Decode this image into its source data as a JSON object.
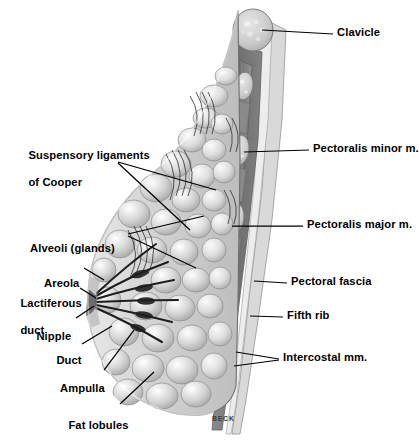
{
  "figure": {
    "signature": "BECK",
    "background_color": "#ffffff",
    "line_color": "#000000",
    "tissue_tones": {
      "fat_light": "#e3e3e3",
      "fat_mid": "#c4c4c4",
      "gland_light": "#efefef",
      "gland_shadow": "#9a9a9a",
      "muscle_dark": "#7e7e7e",
      "muscle_darker": "#6a6a6a",
      "bone_light": "#d8d8d8",
      "outline": "#4a4a4a"
    }
  },
  "labels_left": [
    {
      "id": "suspensory-ligaments-of-cooper",
      "line1": "Suspensory ligaments",
      "line2": "of Cooper",
      "x": 22,
      "y": 136
    },
    {
      "id": "alveoli-glands",
      "line1": "Alveoli (glands)",
      "line2": "",
      "x": 24,
      "y": 229
    },
    {
      "id": "areola",
      "line1": "Areola",
      "line2": "",
      "x": 38,
      "y": 264
    },
    {
      "id": "lactiferous-duct",
      "line1": "Lactiferous",
      "line2": "duct",
      "x": 14,
      "y": 284
    },
    {
      "id": "nipple",
      "line1": "Nipple",
      "line2": "",
      "x": 30,
      "y": 317
    },
    {
      "id": "duct",
      "line1": "Duct",
      "line2": "",
      "x": 50,
      "y": 341
    },
    {
      "id": "ampulla",
      "line1": "Ampulla",
      "line2": "",
      "x": 54,
      "y": 369
    },
    {
      "id": "fat-lobules",
      "line1": "Fat lobules",
      "line2": "",
      "x": 62,
      "y": 406
    }
  ],
  "labels_right": [
    {
      "id": "clavicle",
      "text": "Clavicle",
      "x": 337,
      "y": 33
    },
    {
      "id": "pectoralis-minor-m",
      "text": "Pectoralis minor m.",
      "x": 313,
      "y": 148
    },
    {
      "id": "pectoralis-major-m",
      "text": "Pectoralis major m.",
      "x": 307,
      "y": 224
    },
    {
      "id": "pectoral-fascia",
      "text": "Pectoral fascia",
      "x": 291,
      "y": 281
    },
    {
      "id": "fifth-rib",
      "text": "Fifth rib",
      "x": 287,
      "y": 315
    },
    {
      "id": "intercostal-mm",
      "text": "Intercostal mm.",
      "x": 283,
      "y": 357
    }
  ]
}
